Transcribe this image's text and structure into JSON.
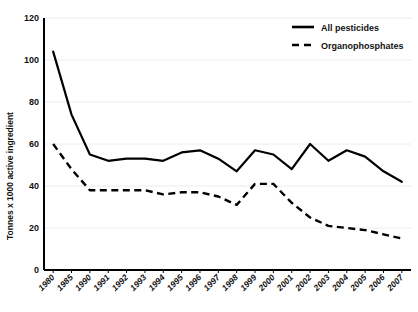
{
  "chart_data": {
    "type": "line",
    "title": "",
    "xlabel": "",
    "ylabel": "Tonnes x 1000 active ingredient",
    "ylim": [
      0,
      120
    ],
    "yticks": [
      0,
      20,
      40,
      60,
      80,
      100,
      120
    ],
    "ytick_labels": [
      "0",
      "20",
      "40",
      "60",
      "80",
      "100",
      "120"
    ],
    "grid": true,
    "grid_axis": "y",
    "legend_position": "top-right",
    "categories": [
      "1980",
      "1985",
      "1990",
      "1991",
      "1992",
      "1993",
      "1994",
      "1995",
      "1996",
      "1997",
      "1998",
      "1999",
      "2000",
      "2001",
      "2002",
      "2003",
      "2004",
      "2005",
      "2006",
      "2007"
    ],
    "series": [
      {
        "name": "All pesticides",
        "style": "solid",
        "color": "#000000",
        "values": [
          104,
          74,
          55,
          52,
          53,
          53,
          52,
          56,
          57,
          53,
          47,
          57,
          55,
          48,
          60,
          52,
          57,
          54,
          47,
          42
        ]
      },
      {
        "name": "Organophosphates",
        "style": "dashed",
        "color": "#000000",
        "values": [
          60,
          48,
          38,
          38,
          38,
          38,
          36,
          37,
          37,
          35,
          31,
          41,
          41,
          32,
          25,
          21,
          20,
          19,
          17,
          15
        ]
      }
    ]
  },
  "legend": {
    "items": [
      {
        "label": "All pesticides",
        "style": "solid"
      },
      {
        "label": "Organophosphates",
        "style": "dashed"
      }
    ]
  },
  "axes": {
    "y_axis_title": "Tonnes x 1000 active ingredient"
  }
}
